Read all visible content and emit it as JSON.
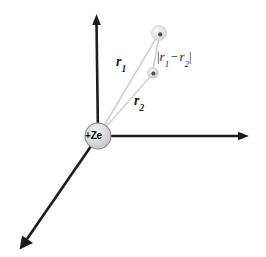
{
  "figure": {
    "background_color": "#ffffff",
    "width": 266,
    "height": 257
  },
  "nucleus": {
    "label": "+Ze",
    "center_x": 98,
    "center_y": 136,
    "radius": 13,
    "fill_color": "#d9d9d9",
    "stroke_color": "#8d8d8d"
  },
  "axes": {
    "stroke_color": "#1c1c1c",
    "items": [
      {
        "name": "vertical-axis",
        "from_x": 98,
        "from_y": 136,
        "to_x": 96,
        "to_y": 18
      },
      {
        "name": "horizontal-axis",
        "from_x": 98,
        "from_y": 136,
        "to_x": 245,
        "to_y": 136
      },
      {
        "name": "diagonal-axis",
        "from_x": 98,
        "from_y": 136,
        "to_x": 23,
        "to_y": 245
      }
    ]
  },
  "electrons": [
    {
      "name": "electron-1",
      "center_x": 159,
      "center_y": 33,
      "radius": 7.5,
      "halo_color": "#dcdcdc",
      "core_color": "#4a4a4a"
    },
    {
      "name": "electron-2",
      "center_x": 153,
      "center_y": 73,
      "radius": 5.5,
      "halo_color": "#cccccc",
      "core_color": "#3f3f3f"
    }
  ],
  "vectors": {
    "stroke_color": "#cfcfcf",
    "items": [
      {
        "name": "r1-vector",
        "from_x": 98,
        "from_y": 136,
        "to_x": 158,
        "to_y": 35
      },
      {
        "name": "r2-vector",
        "from_x": 98,
        "from_y": 136,
        "to_x": 152,
        "to_y": 74
      },
      {
        "name": "separation-vector",
        "from_x": 159,
        "from_y": 36,
        "to_x": 153,
        "to_y": 70
      }
    ]
  },
  "labels": {
    "r1": {
      "symbol": "r",
      "subscript": "1"
    },
    "r2": {
      "symbol": "r",
      "subscript": "2"
    },
    "separation": {
      "open_bar": "|",
      "symbol_1": "r",
      "subscript_1": "1",
      "minus": "−",
      "symbol_2": "r",
      "subscript_2": "2",
      "close_bar": "|",
      "full_text": "|r1 − r2|"
    }
  }
}
